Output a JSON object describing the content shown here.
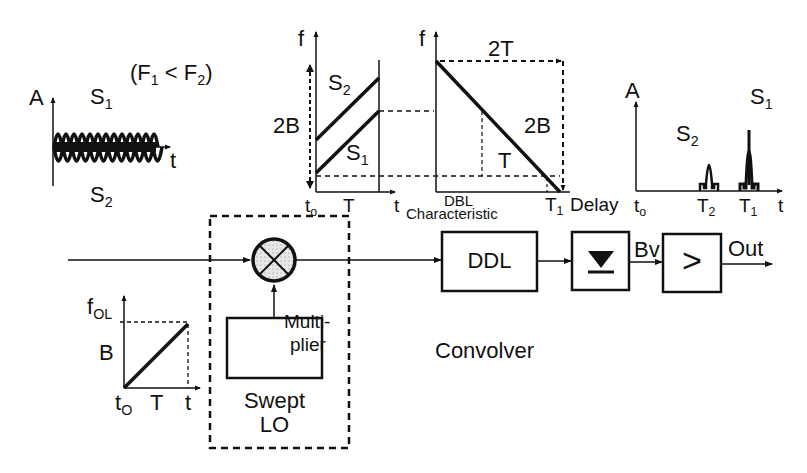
{
  "input_signal": {
    "axis_y": "A",
    "axis_x": "t",
    "s1_label": "S",
    "s1_sub": "1",
    "s2_label": "S",
    "s2_sub": "2",
    "condition": "(F",
    "cond_sub1": "1",
    "cond_mid": " < F",
    "cond_sub2": "2",
    "cond_end": ")"
  },
  "chirp_plot": {
    "axis_y": "f",
    "axis_x": "t",
    "origin": "t",
    "origin_sub": "o",
    "period": "T",
    "span": "2B",
    "s2_label": "S",
    "s2_sub": "2",
    "s1_label": "S",
    "s1_sub": "1"
  },
  "ddl_plot": {
    "axis_y": "f",
    "span_t": "2T",
    "span_f": "2B",
    "inner_t": "T",
    "xlabel_1": "DBL",
    "xlabel_2": "Characteristic",
    "t1": "T",
    "t1_sub": "1",
    "delay": "Delay"
  },
  "output_plot": {
    "axis_y": "A",
    "axis_x": "t",
    "origin": "t",
    "origin_sub": "o",
    "t2": "T",
    "t2_sub": "2",
    "t1": "T",
    "t1_sub": "1",
    "s2_label": "S",
    "s2_sub": "2",
    "s1_label": "S",
    "s1_sub": "1"
  },
  "lo_plot": {
    "axis_y": "f",
    "axis_y_sub": "OL",
    "span": "B",
    "origin": "t",
    "origin_sub": "O",
    "period": "T",
    "axis_x": "t"
  },
  "blocks": {
    "multiplier": "Multi-",
    "multiplier2": "plier",
    "swept_lo_1": "Swept",
    "swept_lo_2": "LO",
    "ddl": "DDL",
    "bv": "Bv",
    "comparator": ">",
    "out": "Out",
    "title": "Convolver"
  },
  "colors": {
    "ink": "#111111",
    "background": "#ffffff",
    "mixer_fill": "#e4e4e4"
  }
}
